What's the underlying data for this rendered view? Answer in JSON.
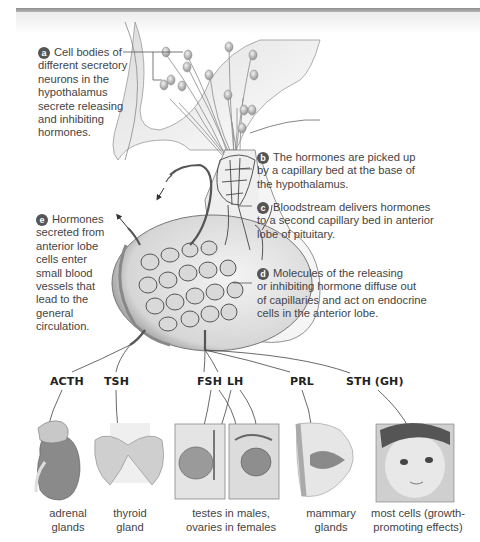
{
  "figure": {
    "type": "diagram"
  },
  "callouts": [
    {
      "letter": "a",
      "text": "Cell bodies of different secretory neurons in the hypothalamus secrete releasing and inhibiting hormones.",
      "lines": [
        "Cell bodies of",
        "different secretory",
        "neurons in the",
        "hypothalamus",
        "secrete releasing",
        "and inhibiting",
        "hormones."
      ]
    },
    {
      "letter": "b",
      "text": "The hormones are picked up by a capillary bed at the base of the hypothalamus.",
      "lines": [
        "The hormones are picked up",
        "by a capillary bed at the base of",
        "the hypothalamus."
      ]
    },
    {
      "letter": "c",
      "text": "Bloodstream delivers hormones to a second capillary bed in anterior lobe of pituitary.",
      "lines": [
        "Bloodstream delivers hormones",
        "to a second capillary bed in anterior",
        "lobe of pituitary."
      ]
    },
    {
      "letter": "d",
      "text": "Molecules of the releasing or inhibiting hormone diffuse out of capillaries and act on endocrine cells in the anterior lobe.",
      "lines": [
        "Molecules of the releasing",
        "or inhibiting hormone diffuse out",
        "of capillaries and act on endocrine",
        "cells in the anterior lobe."
      ]
    },
    {
      "letter": "e",
      "text": "Hormones secreted from anterior lobe cells enter small blood vessels that lead to the general circulation.",
      "lines": [
        "Hormones",
        "secreted from",
        "anterior lobe",
        "cells enter",
        "small blood",
        "vessels that",
        "lead to the",
        "general",
        "circulation."
      ]
    }
  ],
  "hormones": [
    "ACTH",
    "TSH",
    "FSH",
    "LH",
    "PRL",
    "STH (GH)"
  ],
  "targets": [
    {
      "lines": [
        "adrenal",
        "glands"
      ],
      "image": "adrenal-gland-illustration"
    },
    {
      "lines": [
        "thyroid",
        "gland"
      ],
      "image": "thyroid-gland-illustration"
    },
    {
      "lines": [
        "testes in males,",
        "ovaries in females"
      ],
      "image": "testis-ovary-illustration"
    },
    {
      "lines": [
        "mammary",
        "glands"
      ],
      "image": "mammary-gland-illustration"
    },
    {
      "lines": [
        "most cells (growth-",
        "promoting effects)"
      ],
      "image": "infant-photo"
    }
  ],
  "colors": {
    "badge": "#555555",
    "text": "#444444",
    "line": "#555555",
    "topbar": "#9a9a9a"
  }
}
